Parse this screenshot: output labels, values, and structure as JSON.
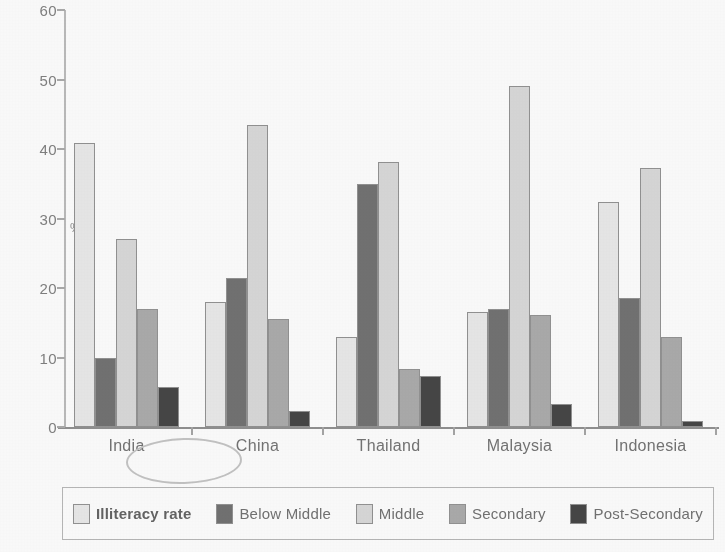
{
  "chart_data": {
    "type": "bar",
    "title": "",
    "xlabel": "",
    "ylabel": "%",
    "ylim": [
      0,
      60
    ],
    "yticks": [
      0,
      10,
      20,
      30,
      40,
      50,
      60
    ],
    "grid": false,
    "legend_position": "bottom",
    "categories": [
      "India",
      "China",
      "Thailand",
      "Malaysia",
      "Indonesia"
    ],
    "series": [
      {
        "name": "Illiteracy rate",
        "color": "#e9e9e9",
        "values": [
          40.8,
          18.0,
          12.9,
          16.5,
          32.4
        ]
      },
      {
        "name": "Below Middle",
        "color": "#6d6d6d",
        "values": [
          10.0,
          21.5,
          35.0,
          17.0,
          18.5
        ]
      },
      {
        "name": "Middle",
        "color": "#d8d8d8",
        "values": [
          27.1,
          43.5,
          38.1,
          49.0,
          37.2
        ]
      },
      {
        "name": "Secondary",
        "color": "#a9a9a9",
        "values": [
          17.0,
          15.6,
          8.4,
          16.1,
          13.0
        ]
      },
      {
        "name": "Post-Secondary",
        "color": "#3f3f3f",
        "values": [
          5.8,
          2.3,
          7.4,
          3.3,
          0.8
        ]
      }
    ],
    "annotations": [
      {
        "type": "ellipse",
        "target": "India",
        "note": "hand-drawn circle around the India category label"
      }
    ]
  },
  "axis": {
    "y_title": "%",
    "tick_labels": [
      "60",
      "50",
      "40",
      "30",
      "20",
      "10",
      "0"
    ]
  },
  "legend": {
    "items": [
      {
        "label": "Illiteracy rate",
        "color": "#e9e9e9",
        "bold": true
      },
      {
        "label": "Below Middle",
        "color": "#6d6d6d",
        "bold": false
      },
      {
        "label": "Middle",
        "color": "#d8d8d8",
        "bold": false
      },
      {
        "label": "Secondary",
        "color": "#a9a9a9",
        "bold": false
      },
      {
        "label": "Post-Secondary",
        "color": "#3f3f3f",
        "bold": false
      }
    ]
  }
}
